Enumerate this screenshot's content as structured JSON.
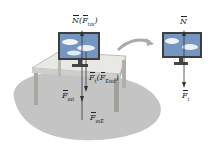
{
  "left_scene": {
    "top_label": {
      "main": "N",
      "paren_open": "(",
      "paren_vec": "F",
      "paren_sub": "tm",
      "paren_close": ")"
    },
    "mid_label": {
      "main": "F",
      "main_sub": "t",
      "paren_open": "(",
      "paren_vec": "F",
      "paren_sub": "Emt",
      "paren_close": ")"
    },
    "left_label": {
      "main": "F",
      "sub": "mt"
    },
    "bottom_label": {
      "main": "F",
      "sub": "mE"
    }
  },
  "right_scene": {
    "top_label": {
      "main": "N"
    },
    "bottom_label": {
      "main": "F",
      "sub": "t"
    }
  },
  "colors": {
    "shadow": "#bdbdbd",
    "table_top": "#e6e6e2",
    "table_side": "#9a9a96",
    "arrow": "#333333",
    "sky": "#6f8fb8"
  }
}
